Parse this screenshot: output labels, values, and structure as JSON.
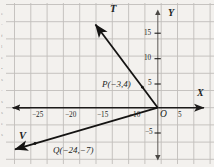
{
  "figure": {
    "background_color": "#f3f1ee",
    "grid_color": "#b9b6b2",
    "axis_color": "#1d1b1a",
    "ray_color": "#141312",
    "axes": {
      "x_label": "X",
      "y_label": "Y",
      "origin_label": "O"
    },
    "x_ticks": [
      {
        "label": "−25",
        "value": -25
      },
      {
        "label": "−20",
        "value": -20
      },
      {
        "label": "−15",
        "value": -15
      },
      {
        "label": "−10",
        "value": -10
      },
      {
        "label": "5",
        "value": 5
      }
    ],
    "y_ticks": [
      {
        "label": "15",
        "value": 15
      },
      {
        "label": "10",
        "value": 10
      },
      {
        "label": "5",
        "value": 5
      },
      {
        "label": "−5",
        "value": -5
      }
    ],
    "rays": [
      {
        "name": "T",
        "label": "T",
        "from": [
          0,
          0
        ],
        "through": [
          -3,
          4
        ],
        "point_label": "P(−3,4)",
        "point_name": "P",
        "point_coords": [
          -3,
          4
        ]
      },
      {
        "name": "V",
        "label": "V",
        "from": [
          0,
          0
        ],
        "through": [
          -24,
          -7
        ],
        "point_label": "Q(−24,−7)",
        "point_name": "Q",
        "point_coords": [
          -24,
          -7
        ]
      }
    ],
    "margin_text": [
      "e",
      "-",
      "f",
      "l",
      "e",
      "•",
      "s",
      "-",
      "s",
      "s",
      "e",
      "s"
    ]
  }
}
